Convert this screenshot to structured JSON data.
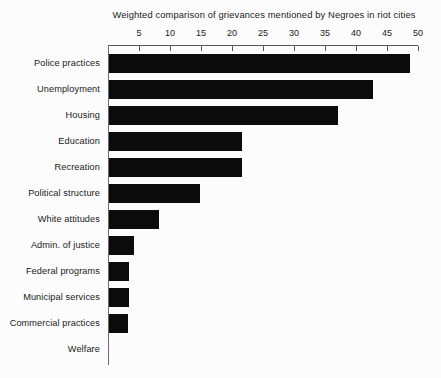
{
  "chart_data": {
    "type": "bar",
    "orientation": "horizontal",
    "title": "Weighted comparison of grievances mentioned by Negroes in riot cities",
    "xlabel": "",
    "ylabel": "",
    "xlim": [
      0,
      50
    ],
    "xticks": [
      5,
      10,
      15,
      20,
      25,
      30,
      35,
      40,
      45,
      50
    ],
    "xtick_labels": [
      "5",
      "10",
      "15",
      "20",
      "25",
      "30",
      "35",
      "40",
      "45",
      "50"
    ],
    "grid": false,
    "legend": false,
    "axis_position": "top",
    "bar_color": "#0b0b0b",
    "axis_color": "#58585a",
    "categories": [
      "Police practices",
      "Unemployment",
      "Housing",
      "Education",
      "Recreation",
      "Political structure",
      "White attitudes",
      "Admin. of justice",
      "Federal programs",
      "Municipal services",
      "Commercial practices",
      "Welfare"
    ],
    "values": [
      48.5,
      42.5,
      37.0,
      21.5,
      21.5,
      14.7,
      8.0,
      4.0,
      3.3,
      3.2,
      3.1,
      0.0
    ]
  }
}
